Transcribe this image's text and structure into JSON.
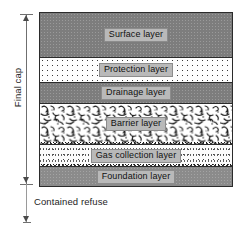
{
  "figure": {
    "left_annotation": {
      "bracket_label": "Final cap",
      "below_label": "Contained refuse"
    },
    "layers": [
      {
        "id": "surface",
        "label": "Surface layer",
        "fill": "#7d7d7d",
        "pattern": "solid-grey"
      },
      {
        "id": "protection",
        "label": "Protection layer",
        "fill": "#fdfdfd",
        "pattern": "sand-stipple"
      },
      {
        "id": "drainage",
        "label": "Drainage layer",
        "fill": "#7d7d7d",
        "pattern": "solid-grey"
      },
      {
        "id": "barrier",
        "label": "Barrier layer",
        "fill": "#ffffff",
        "pattern": "clay-squiggle"
      },
      {
        "id": "gas",
        "label": "Gas collection layer",
        "fill": "#fbfbfb",
        "pattern": "sand-stipple-dense"
      },
      {
        "id": "foundation",
        "label": "Foundation layer",
        "fill": "#8b8b8b",
        "pattern": "solid-grey"
      }
    ],
    "colors": {
      "solid_grey": "#7d7d7d",
      "foundation_grey": "#8b8b8b",
      "outline": "#2b2b2b",
      "label_box": "#b9b9b9",
      "label_border": "#8c8c8c",
      "text": "#111111",
      "dimension_line": "#6f6f6f"
    }
  }
}
